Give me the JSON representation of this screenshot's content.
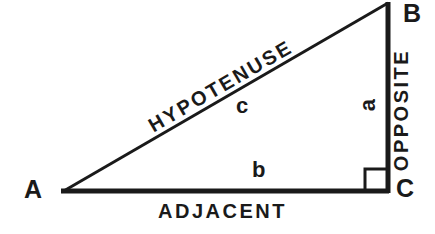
{
  "diagram": {
    "type": "right-triangle",
    "background_color": "#ffffff",
    "stroke_color": "#1a1a1a",
    "vertices": [
      {
        "id": "A",
        "label": "A",
        "x": 62,
        "y": 192,
        "angle_type": "acute"
      },
      {
        "id": "B",
        "label": "B",
        "x": 388,
        "y": 3,
        "angle_type": "acute"
      },
      {
        "id": "C",
        "label": "C",
        "x": 388,
        "y": 192,
        "angle_type": "right"
      }
    ],
    "sides": [
      {
        "id": "hypotenuse",
        "letter": "c",
        "name": "HYPOTENUSE",
        "from": "A",
        "to": "B",
        "stroke_width": 3
      },
      {
        "id": "adjacent",
        "letter": "b",
        "name": "ADJACENT",
        "from": "A",
        "to": "C",
        "stroke_width": 5
      },
      {
        "id": "opposite",
        "letter": "a",
        "name": "OPPOSITE",
        "from": "C",
        "to": "B",
        "stroke_width": 5
      }
    ],
    "right_angle_marker": {
      "at_vertex": "C",
      "size": 22,
      "stroke_width": 3
    }
  }
}
